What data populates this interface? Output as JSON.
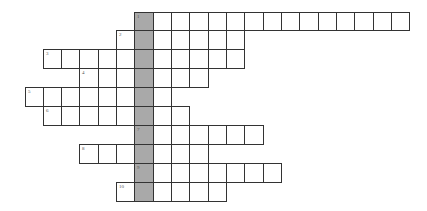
{
  "puzzle": {
    "type": "crossword",
    "origin_x": 24.5,
    "origin_y": 11.5,
    "cell_w": 18.33,
    "cell_h": 18.9,
    "highlight_col": 6,
    "highlight_color": "#a9a9a9",
    "border_color": "#333333",
    "rows": [
      {
        "number": "1",
        "start_col": 6,
        "end_col": 20
      },
      {
        "number": "2",
        "start_col": 5,
        "end_col": 11
      },
      {
        "number": "3",
        "start_col": 1,
        "end_col": 11
      },
      {
        "number": "4",
        "start_col": 3,
        "end_col": 9
      },
      {
        "number": "5",
        "start_col": 0,
        "end_col": 7
      },
      {
        "number": "6",
        "start_col": 1,
        "end_col": 8
      },
      {
        "number": "7",
        "start_col": 6,
        "end_col": 12
      },
      {
        "number": "8",
        "start_col": 3,
        "end_col": 9
      },
      {
        "number": "9",
        "start_col": 6,
        "end_col": 13
      },
      {
        "number": "10",
        "start_col": 5,
        "end_col": 10
      }
    ]
  }
}
